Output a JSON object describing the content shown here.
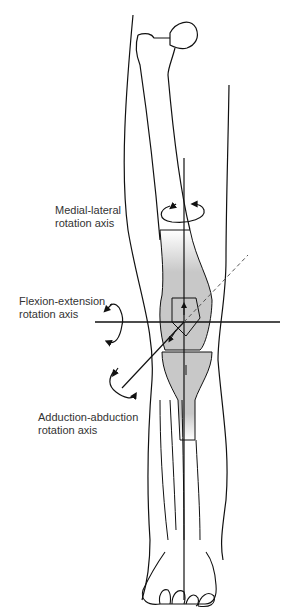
{
  "figure": {
    "labels": {
      "medial_lateral": {
        "line1": "Medial-lateral",
        "line2": "rotation axis"
      },
      "flexion_extension": {
        "line1": "Flexion-extension",
        "line2": "rotation axis"
      },
      "adduction_abduction": {
        "line1": "Adduction-abduction",
        "line2": "rotation axis"
      }
    },
    "colors": {
      "line": "#111111",
      "shade": "#c8c8c8",
      "text": "#333333"
    }
  }
}
